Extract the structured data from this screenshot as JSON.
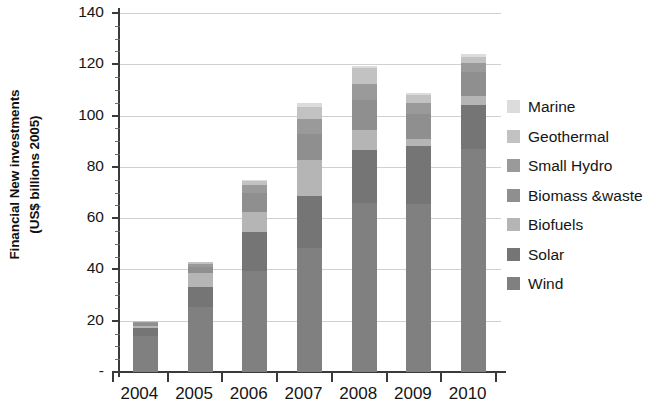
{
  "chart_data": {
    "type": "bar",
    "stacked": true,
    "title": "",
    "xlabel": "",
    "ylabel": "Financial New investments\n(US$ billions 2005)",
    "categories": [
      "2004",
      "2005",
      "2006",
      "2007",
      "2008",
      "2009",
      "2010"
    ],
    "ylim": [
      0,
      140
    ],
    "yticks": [
      0,
      20,
      40,
      60,
      80,
      100,
      120,
      140
    ],
    "ytick_labels": [
      "-",
      "20",
      "40",
      "60",
      "80",
      "100",
      "120",
      "140"
    ],
    "grid": true,
    "legend_position": "right",
    "series": [
      {
        "name": "Wind",
        "color": "#808080",
        "values": [
          14.0,
          25.5,
          39.5,
          48.5,
          66.0,
          65.5,
          87.0
        ]
      },
      {
        "name": "Solar",
        "color": "#757575",
        "values": [
          3.0,
          7.5,
          15.0,
          20.0,
          20.5,
          22.5,
          17.0
        ]
      },
      {
        "name": "Biofuels",
        "color": "#b5b5b5",
        "values": [
          1.0,
          5.5,
          8.0,
          14.0,
          8.0,
          3.0,
          3.5
        ]
      },
      {
        "name": "Biomass &waste",
        "color": "#8f8f8f",
        "values": [
          1.0,
          2.5,
          7.5,
          10.5,
          11.5,
          9.5,
          9.5
        ]
      },
      {
        "name": "Small Hydro",
        "color": "#9a9a9a",
        "values": [
          0.6,
          1.0,
          3.0,
          5.5,
          6.5,
          4.5,
          3.5
        ]
      },
      {
        "name": "Geothermal",
        "color": "#c2c2c2",
        "values": [
          0.3,
          0.8,
          1.5,
          5.0,
          6.0,
          3.0,
          2.5
        ]
      },
      {
        "name": "Marine",
        "color": "#dcdcdc",
        "values": [
          0.1,
          0.2,
          0.5,
          1.5,
          1.0,
          1.0,
          1.0
        ]
      }
    ],
    "totals": [
      20.0,
      43.0,
      75.0,
      105.0,
      119.5,
      109.0,
      124.0
    ]
  },
  "legend": {
    "items": [
      {
        "label": "Marine",
        "color": "#dcdcdc"
      },
      {
        "label": "Geothermal",
        "color": "#c2c2c2"
      },
      {
        "label": "Small Hydro",
        "color": "#9a9a9a"
      },
      {
        "label": "Biomass &waste",
        "color": "#8f8f8f"
      },
      {
        "label": "Biofuels",
        "color": "#b5b5b5"
      },
      {
        "label": "Solar",
        "color": "#757575"
      },
      {
        "label": "Wind",
        "color": "#808080"
      }
    ]
  },
  "axes": {
    "y_title_line1": "Financial New investments",
    "y_title_line2": "(US$ billions 2005)"
  }
}
